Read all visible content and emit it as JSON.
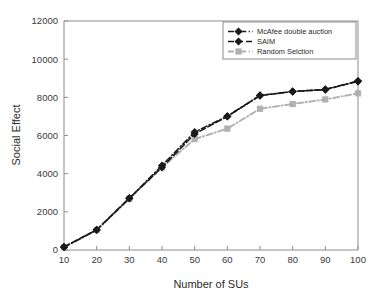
{
  "chart_data": {
    "type": "line",
    "title": "",
    "xlabel": "Number of SUs",
    "ylabel": "Social Effect",
    "x": [
      10,
      20,
      30,
      40,
      50,
      60,
      70,
      80,
      90,
      100
    ],
    "xlim": [
      10,
      100
    ],
    "ylim": [
      0,
      12000
    ],
    "xticks": [
      "10",
      "20",
      "30",
      "40",
      "50",
      "60",
      "70",
      "80",
      "90",
      "100"
    ],
    "yticks": [
      "0",
      "2000",
      "4000",
      "6000",
      "8000",
      "10000",
      "12000"
    ],
    "grid": false,
    "legend_position": "upper right",
    "series": [
      {
        "name": "McAfee double auction",
        "color": "#1a1a1a",
        "marker": "diamond",
        "linestyle": "dashdot",
        "values": [
          150,
          1050,
          2700,
          4430,
          6180,
          7010,
          8100,
          8300,
          8420,
          8850
        ]
      },
      {
        "name": "SAIM",
        "color": "#1a1a1a",
        "marker": "diamond",
        "linestyle": "dashed",
        "values": [
          160,
          1060,
          2720,
          4330,
          6080,
          7000,
          8090,
          8310,
          8400,
          8840
        ]
      },
      {
        "name": "Random Selction",
        "color": "#b0b0b0",
        "marker": "square",
        "linestyle": "dashdot",
        "values": [
          150,
          1040,
          2690,
          4330,
          5810,
          6360,
          7400,
          7650,
          7890,
          8210
        ]
      }
    ]
  },
  "axes": {
    "y_title": "Social Effect",
    "x_title": "Number of SUs"
  },
  "legend": {
    "entries": [
      {
        "label": "McAfee double auction"
      },
      {
        "label": "SAIM"
      },
      {
        "label": "Random Selction"
      }
    ]
  }
}
